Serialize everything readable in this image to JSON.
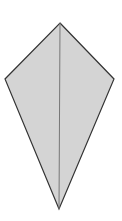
{
  "diagram": {
    "shape": "kite",
    "canvas": {
      "width": 122,
      "height": 221,
      "background": "#ffffff"
    },
    "vertices": {
      "top": [
        60,
        23
      ],
      "right": [
        114,
        79
      ],
      "bottom": [
        59,
        209
      ],
      "left": [
        5,
        79
      ]
    },
    "axis_line": {
      "from": [
        60,
        23
      ],
      "to": [
        59,
        209
      ]
    },
    "colors": {
      "fill": "#d4d4d4",
      "outline": "#333333",
      "axis_line": "#777777"
    },
    "stroke_widths": {
      "outline": 1.2,
      "axis_line": 1
    }
  }
}
